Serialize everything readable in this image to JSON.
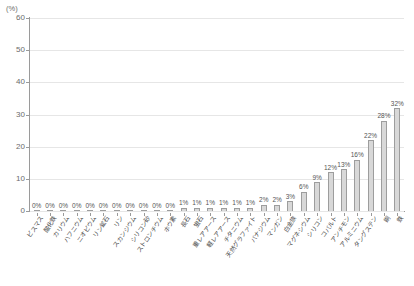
{
  "chart_data": {
    "type": "bar",
    "title": "",
    "subtitle": "",
    "xlabel": "",
    "ylabel": "(%)",
    "ylim": [
      0,
      60
    ],
    "ytick_values": [
      0,
      10,
      20,
      30,
      40,
      50,
      60
    ],
    "ytick_labels": [
      "0",
      "10",
      "20",
      "30",
      "40",
      "50",
      "60"
    ],
    "grid": true,
    "legend": false,
    "legend_position": "none",
    "bar_fill_color": "#d8d8d8",
    "bar_edge_color": "#9d9d9d",
    "axis_color": "#9a9a9a",
    "gridline_color": "#e6e6e6",
    "text_color": "#4a4a4a",
    "value_label_suffix": "%",
    "categories": [
      "ビスマス",
      "酸化鉄",
      "カリウム",
      "ハフニウム",
      "ニオビウム",
      "リン鉱石",
      "リン",
      "スカンジウム",
      "シリコン砂",
      "ストロンチウム",
      "ホウ素",
      "長石",
      "蛍石",
      "重レアアース",
      "軽レアアース",
      "チタニウム",
      "天然グラファイト",
      "バナジウム",
      "マンガン",
      "白金族",
      "マグネシウム",
      "シリコン",
      "コバルト",
      "アンチモン",
      "アルミニウム",
      "タングステン",
      "銅",
      "鉄"
    ],
    "values": [
      0,
      0,
      0,
      0,
      0,
      0,
      0,
      0,
      0,
      0,
      0,
      1,
      1,
      1,
      1,
      1,
      1,
      2,
      2,
      3,
      6,
      9,
      12,
      13,
      16,
      22,
      28,
      32
    ],
    "value_labels": [
      "0%",
      "0%",
      "0%",
      "0%",
      "0%",
      "0%",
      "0%",
      "0%",
      "0%",
      "0%",
      "0%",
      "1%",
      "1%",
      "1%",
      "1%",
      "1%",
      "1%",
      "2%",
      "2%",
      "3%",
      "6%",
      "9%",
      "12%",
      "13%",
      "16%",
      "22%",
      "28%",
      "32%"
    ]
  }
}
